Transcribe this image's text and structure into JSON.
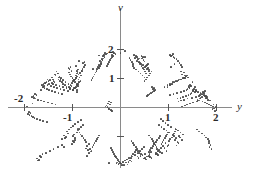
{
  "figure": {
    "background_color": "#ffffff",
    "point_color": "#4a4a4a",
    "axis_color": "#8a8a8a",
    "label_color": "#2a2a2a"
  },
  "axes": {
    "vertical": {
      "name": "v",
      "tick_labels": [
        "2",
        "1"
      ],
      "tick_values": [
        2,
        1
      ]
    },
    "horizontal": {
      "name": "y",
      "tick_labels": [
        "-2",
        "-1",
        "1",
        "2"
      ],
      "tick_values": [
        -2,
        -1,
        1,
        2
      ]
    }
  },
  "chart_data": {
    "type": "scatter",
    "title": "",
    "xlabel": "y",
    "ylabel": "v",
    "xlim": [
      -2.33,
      2.33
    ],
    "ylim": [
      -2.06,
      2.33
    ],
    "grid": false,
    "legend": null,
    "marker": {
      "shape": "circle",
      "size": 1.7,
      "color": "#4a4a4a"
    },
    "n_points": 700,
    "region": {
      "shape": "ellipse",
      "center": [
        0.0,
        0.07
      ],
      "semi_axis_x": 2.1,
      "semi_axis_y": 1.95
    },
    "x": [
      -0.01,
      1.12,
      -1.53,
      0.64,
      -0.87,
      1.78,
      0.22,
      -1.19,
      1.41,
      -0.46,
      0.95,
      -1.84,
      0.08,
      1.62,
      -0.71,
      0.39,
      -1.31,
      1.05,
      -0.25,
      1.93,
      -0.58,
      0.77,
      -1.67,
      0.14,
      1.25,
      -1.02,
      0.51,
      -1.95,
      1.49,
      -0.33,
      0.86,
      -1.44,
      0.03,
      1.71,
      -0.94,
      0.61,
      -1.22,
      1.34,
      -0.17,
      1.86,
      -0.68,
      0.43,
      -1.58,
      1.16,
      -0.05,
      1.99,
      -0.81,
      0.72,
      -1.37,
      0.28,
      1.55,
      -1.09,
      0.48,
      -1.79,
      1.27,
      -0.39,
      0.91,
      -1.51,
      0.11,
      1.66,
      -0.76,
      0.35,
      -1.28,
      1.09,
      -0.21,
      1.89,
      -0.63,
      0.68,
      -1.72,
      0.18,
      1.31,
      -0.98,
      0.55,
      -1.91,
      1.44,
      -0.29,
      0.82,
      -1.47,
      0.06,
      1.75,
      -0.89,
      0.58,
      -1.16,
      1.38,
      -0.13,
      1.82,
      -0.72,
      0.46,
      -1.61,
      1.2,
      -0.09,
      1.96,
      -0.85,
      0.75,
      -1.34,
      0.31,
      1.52,
      -1.05,
      0.52,
      -1.76,
      1.23,
      -0.43,
      0.97,
      -1.55,
      0.16,
      1.69,
      -0.79,
      0.37,
      -1.25,
      1.02,
      -0.24,
      1.85,
      -0.66,
      0.65,
      -1.7,
      0.2,
      1.28,
      -1.0,
      0.57,
      -1.88,
      1.46,
      -0.31,
      0.79,
      -1.42,
      0.01,
      1.73,
      -0.92,
      0.6,
      -1.14,
      1.36,
      -0.15,
      1.8,
      -0.7,
      0.44,
      -1.64,
      1.18,
      -0.07,
      1.91,
      -0.83,
      0.73,
      -1.32,
      0.33,
      1.57,
      -1.07,
      0.5,
      -1.82,
      1.21,
      -0.41,
      0.99,
      -1.57,
      0.19,
      1.64,
      -0.74,
      0.41,
      -1.3,
      1.07,
      -0.27,
      1.87,
      -0.61,
      0.7,
      -1.74,
      0.23,
      1.33,
      -0.96,
      0.53,
      -1.93,
      1.42,
      -0.35,
      0.84,
      -1.4,
      -0.02,
      1.68,
      -0.9,
      0.63,
      -1.18,
      1.4,
      -0.11,
      1.77,
      -0.67,
      0.47,
      -1.6,
      1.13,
      -0.04,
      1.94,
      -0.86,
      0.78,
      -1.36,
      0.29,
      1.5,
      -1.03,
      0.54,
      -1.85,
      1.3,
      -0.45,
      0.93,
      -1.49,
      0.13,
      1.6,
      -0.77,
      0.42,
      -1.27,
      1.04,
      -0.22,
      1.83,
      -0.64,
      0.67,
      -1.66,
      0.25,
      1.35,
      -0.95,
      0.56,
      -1.9,
      1.43,
      -0.37,
      0.88,
      -1.38,
      0.04,
      1.65,
      -0.91,
      0.62,
      -1.1,
      1.32,
      -0.19,
      1.79,
      -0.73,
      0.49,
      -1.62,
      1.15,
      -0.06,
      1.97,
      -0.88,
      0.76,
      -1.29,
      0.36,
      1.54,
      -1.08,
      0.45,
      -1.81,
      1.24,
      -0.47,
      1.01,
      -1.53,
      0.21,
      1.61,
      -0.8,
      0.38,
      -1.23,
      1.1,
      -0.3,
      1.84,
      -0.59,
      0.71,
      -1.68,
      0.26,
      1.29,
      -0.99,
      0.59,
      -1.86,
      1.39,
      -0.34,
      0.85,
      -1.43,
      0.09,
      1.63,
      -0.93,
      0.66,
      -1.12,
      1.26,
      -0.16,
      1.76,
      -0.75,
      0.4,
      -1.59,
      1.11,
      -0.08,
      1.92,
      -0.84,
      0.74,
      -1.26,
      0.34,
      1.47,
      -1.06,
      0.51,
      -1.78,
      1.19,
      -0.49,
      1.03,
      -1.46,
      0.24,
      1.58,
      -0.82,
      0.36,
      -1.2,
      1.12,
      -0.32,
      1.81,
      -0.57,
      0.69,
      -1.63,
      0.27,
      1.22,
      -0.97,
      0.64,
      -1.83,
      1.37,
      -0.36,
      0.87,
      -1.41,
      0.12,
      1.56,
      -0.94,
      0.68,
      -1.08,
      1.2,
      -0.18,
      1.73,
      -0.78,
      0.39,
      -1.54,
      1.08,
      -0.1,
      1.88,
      -0.87,
      0.72,
      -1.21,
      0.38,
      1.45,
      -1.04,
      0.58,
      -1.73,
      1.14,
      -0.51,
      1.06,
      -1.39,
      0.3,
      1.51,
      -0.85,
      0.34,
      -1.17,
      1.16,
      -0.28,
      1.78,
      -0.55,
      0.66,
      -1.56,
      0.32,
      1.17,
      -0.92,
      0.61,
      -1.8,
      1.31,
      -0.38,
      0.89,
      -1.35,
      0.17,
      1.48,
      -0.96,
      0.7,
      -1.04,
      1.14,
      -0.2,
      1.7,
      -0.81,
      0.43,
      -1.5,
      1.0,
      -0.12,
      1.84,
      -0.89,
      0.69,
      -1.15,
      0.42,
      1.41,
      -1.01,
      0.6,
      -1.67,
      1.05,
      -0.53,
      1.08,
      -1.33,
      0.35,
      1.44,
      -0.88,
      0.31,
      -1.13,
      1.19,
      -0.26,
      1.74,
      -0.52,
      0.63,
      -1.48,
      0.37,
      1.12,
      -0.9,
      0.58,
      -1.75,
      1.25,
      -0.4,
      0.92,
      -1.28,
      0.22,
      1.39,
      -0.99,
      0.73,
      -1.0,
      1.09,
      -0.23,
      1.66,
      -0.84,
      0.46,
      -1.44,
      0.95,
      -0.14,
      1.8,
      -0.91,
      0.67,
      -1.09,
      0.46,
      1.36,
      -0.98,
      0.63,
      -1.6,
      0.98,
      -0.55,
      1.11,
      -1.26,
      0.4,
      1.38,
      -0.91,
      0.28,
      -1.06,
      1.22,
      -0.24,
      1.69,
      -0.5,
      0.6,
      -1.4,
      0.41,
      1.07,
      -0.87,
      0.55,
      -1.69,
      1.17,
      -0.42,
      0.94,
      -1.2,
      0.26,
      1.32,
      -1.02,
      0.76,
      -0.95,
      1.03,
      -0.25,
      1.61,
      -0.86,
      0.48,
      -1.37,
      0.9,
      -0.16,
      1.75,
      -0.93,
      0.65,
      -1.03,
      0.5,
      1.3,
      -0.95,
      0.66,
      -1.52,
      0.93,
      -0.57,
      1.13,
      -1.18,
      0.44,
      1.33,
      -0.94,
      0.25,
      -0.99,
      1.25,
      -0.21,
      1.64,
      -0.48,
      0.57,
      -1.31,
      0.45,
      1.02,
      -0.83,
      0.52,
      -1.62,
      1.1,
      -0.44,
      0.96,
      -1.13,
      0.29,
      1.26,
      -1.05,
      0.79,
      -0.89,
      0.97,
      -0.27,
      1.56,
      -0.88,
      0.5,
      -1.3,
      0.85,
      -0.18,
      1.7,
      -0.96,
      0.62,
      -0.97,
      0.54,
      1.24,
      -0.92,
      0.69,
      -1.44,
      0.88,
      -0.59,
      1.15,
      -1.1,
      0.48,
      1.27,
      -0.97,
      0.22,
      -0.92,
      1.28,
      -0.19,
      1.58,
      -0.46,
      0.54,
      -1.22,
      0.49,
      0.97,
      -0.79,
      0.49,
      -1.54,
      1.03,
      -0.46,
      0.98,
      -1.06,
      0.32,
      1.2,
      -1.08,
      0.82,
      -0.83,
      0.91,
      -0.29,
      1.5,
      -0.9,
      0.53,
      -1.23,
      0.8,
      -0.2,
      1.64,
      -0.99,
      0.59,
      -0.91,
      0.58,
      1.18,
      -0.89,
      0.72,
      -1.36,
      0.83,
      -0.61,
      1.17,
      -1.02,
      0.52,
      1.21,
      -1.0,
      0.19,
      -0.85,
      1.31,
      -0.17,
      1.52,
      -0.44,
      0.51,
      -1.14,
      0.53,
      0.92,
      -0.75,
      0.46,
      -1.45,
      0.96,
      -0.48,
      1.0,
      -0.99,
      0.35,
      1.14,
      -1.11,
      0.85,
      -0.77,
      0.85,
      -0.31,
      1.43,
      -0.92,
      0.56,
      -1.16,
      0.75,
      -0.22,
      1.57,
      -1.02,
      0.56,
      -0.85,
      0.62,
      1.12,
      -0.86,
      0.75,
      -1.28,
      0.78,
      -0.63,
      1.19,
      -0.94,
      0.56,
      1.15,
      -1.03,
      0.16,
      -0.78,
      1.34,
      -0.15,
      1.46,
      -0.42,
      0.48,
      -1.06,
      0.57,
      0.87,
      -0.71,
      0.43,
      -1.37,
      0.89,
      -0.5,
      1.02,
      -0.92,
      0.38,
      1.08,
      -1.14,
      0.88,
      -0.71,
      0.79,
      -0.33,
      1.37,
      -0.94,
      0.59,
      -1.09,
      0.7,
      -0.24,
      1.51,
      -1.05,
      0.53,
      -0.79,
      0.66,
      1.06,
      -0.83,
      0.78,
      -1.2,
      0.73,
      -0.65,
      1.21,
      -0.86,
      0.6,
      1.09,
      -1.06,
      0.13,
      -0.71,
      1.37,
      -0.13,
      1.4,
      -0.4,
      0.45,
      -0.98,
      0.61,
      0.82,
      -0.67,
      0.4,
      -1.29,
      0.82,
      -0.52,
      1.04,
      -0.85,
      0.41,
      1.02,
      -1.17,
      0.91,
      -0.65,
      0.73,
      -0.35,
      1.3,
      -0.96,
      0.62,
      -1.02,
      0.65,
      -0.26,
      1.44,
      -1.08,
      0.5,
      -0.73,
      0.7,
      1.0,
      -0.8,
      0.81,
      -1.12,
      0.68,
      -0.67,
      1.23,
      -0.78,
      0.64,
      1.03,
      -1.09,
      0.1,
      -0.64,
      1.4
    ],
    "y": [
      1.9,
      1.52,
      0.98,
      -1.72,
      1.61,
      0.42,
      -1.85,
      -1.35,
      0.75,
      1.8,
      -1.48,
      0.15,
      1.95,
      -0.82,
      -1.66,
      1.7,
      1.18,
      1.42,
      -1.9,
      0.12,
      1.35,
      -1.62,
      0.62,
      -1.95,
      1.25,
      -1.25,
      1.75,
      0.05,
      0.88,
      1.88,
      -1.55,
      1.05,
      -1.98,
      0.55,
      1.45,
      -1.7,
      -1.08,
      1.02,
      1.92,
      0.25,
      -1.45,
      1.78,
      0.85,
      -1.3,
      -1.93,
      -0.08,
      1.28,
      -1.58,
      1.15,
      1.82,
      0.72,
      1.38,
      -1.75,
      0.48,
      -1.12,
      1.68,
      -1.38,
      0.92,
      -1.89,
      0.35,
      1.58,
      -1.68,
      1.08,
      1.85,
      0.18,
      -1.42,
      -1.5,
      0.68,
      -1.82,
      1.72,
      1.22,
      -1.18,
      1.48,
      -0.15,
      0.78,
      1.87,
      -1.52,
      0.95,
      -1.96,
      0.58,
      1.32,
      -1.65,
      -1.05,
      1.12,
      1.9,
      0.28,
      -1.4,
      1.76,
      0.82,
      -1.22,
      -1.91,
      -0.12,
      1.18,
      -1.6,
      1.25,
      1.79,
      0.65,
      1.42,
      -1.78,
      0.45,
      -1.02,
      1.62,
      -1.32,
      0.88,
      -1.86,
      0.38,
      1.55,
      -1.72,
      1.02,
      1.83,
      0.22,
      -1.35,
      -1.55,
      0.72,
      -1.8,
      1.65,
      1.15,
      -1.15,
      1.52,
      -0.18,
      0.75,
      1.84,
      -1.45,
      0.98,
      -1.92,
      0.52,
      1.28,
      -1.58,
      -1.0,
      1.08,
      1.88,
      0.32,
      -1.32,
      1.7,
      0.78,
      -1.18,
      -1.88,
      -0.05,
      1.12,
      -1.55,
      1.18,
      1.75,
      0.62,
      1.35,
      -1.72,
      0.42,
      -0.98,
      1.55,
      -1.28,
      0.85,
      -1.82,
      0.32,
      1.48,
      -1.65,
      0.98,
      1.8,
      0.15,
      -1.28,
      -1.48,
      0.68,
      -1.75,
      1.58,
      1.12,
      -1.1,
      1.45,
      -0.22,
      0.72,
      1.82,
      -1.38,
      0.92,
      -1.9,
      0.48,
      1.22,
      -1.52,
      -0.95,
      1.05,
      1.85,
      0.35,
      -1.25,
      1.65,
      0.75,
      -1.12,
      -1.85,
      -0.02,
      1.05,
      -1.48,
      1.12,
      1.72,
      0.58,
      1.28,
      -1.68,
      0.38,
      -0.92,
      1.48,
      -1.22,
      0.82,
      -1.78,
      0.28,
      1.42,
      -1.6,
      0.92,
      1.78,
      0.12,
      -1.22,
      -1.42,
      0.65,
      -1.7,
      1.52,
      1.08,
      -1.05,
      1.38,
      -0.25,
      0.68,
      1.78,
      -1.32,
      0.88,
      -1.86,
      0.45,
      1.18,
      -1.45,
      -0.88,
      1.02,
      1.82,
      0.38,
      -1.18,
      1.6,
      0.72,
      -1.05,
      -1.8,
      0.02,
      0.98,
      -1.42,
      1.05,
      1.68,
      0.55,
      1.22,
      -1.62,
      0.35,
      -0.85,
      1.42,
      -1.15,
      0.78,
      -1.72,
      0.25,
      1.35,
      -1.55,
      0.88,
      1.75,
      0.08,
      -1.15,
      -1.35,
      0.62,
      -1.65,
      1.45,
      1.02,
      -0.98,
      1.32,
      -0.28,
      0.65,
      1.75,
      -1.25,
      0.85,
      -1.82,
      0.42,
      1.12,
      -1.38,
      -0.82,
      0.98,
      1.78,
      0.42,
      -1.12,
      1.55,
      0.68,
      -0.98,
      -1.75,
      0.05,
      0.92,
      -1.35,
      1.0,
      1.62,
      0.52,
      1.15,
      -1.58,
      0.32,
      -0.78,
      1.35,
      -1.08,
      0.75,
      -1.68,
      0.22,
      1.28,
      -1.48,
      0.82,
      1.72,
      0.05,
      -1.08,
      -1.28,
      0.58,
      -1.6,
      1.38,
      0.98,
      -0.92,
      1.25,
      -0.32,
      0.62,
      1.7,
      -1.18,
      0.82,
      -1.78,
      0.38,
      1.05,
      -1.32,
      -0.75,
      0.95,
      1.75,
      0.45,
      -1.05,
      1.5,
      0.65,
      -0.92,
      -1.7,
      0.08,
      0.88,
      -1.28,
      0.95,
      1.58,
      0.48,
      1.08,
      -1.52,
      0.28,
      -0.72,
      1.28,
      -1.02,
      0.72,
      -1.62,
      0.18,
      1.22,
      -1.42,
      0.78,
      1.68,
      0.02,
      -1.02,
      -1.22,
      0.55,
      -1.55,
      1.32,
      0.92,
      -0.85,
      1.18,
      -0.35,
      0.58,
      1.65,
      -1.12,
      0.78,
      -1.72,
      0.35,
      0.98,
      -1.25,
      -0.68,
      0.92,
      1.7,
      0.48,
      -0.98,
      1.45,
      0.62,
      -0.85,
      -1.65,
      0.12,
      0.82,
      -1.22,
      0.88,
      1.52,
      0.45,
      1.02,
      -1.45,
      0.25,
      -0.65,
      1.22,
      -0.95,
      0.68,
      -1.55,
      0.15,
      1.15,
      -1.35,
      0.72,
      1.62,
      -0.02,
      -0.95,
      -1.15,
      0.52,
      -1.48,
      1.25,
      0.88,
      -0.78,
      1.12,
      -0.38,
      0.55,
      1.6,
      -1.05,
      0.75,
      -1.65,
      0.32,
      0.92,
      -1.18,
      -0.62,
      0.88,
      1.65,
      0.52,
      -0.92,
      1.38,
      0.58,
      -0.78,
      -1.58,
      0.15,
      0.78,
      -1.15,
      0.82,
      1.48,
      0.42,
      0.95,
      -1.38,
      0.22,
      -0.58,
      1.15,
      -0.88,
      0.65,
      -1.48,
      0.12,
      1.08,
      -1.28,
      0.68,
      1.55,
      -0.05,
      -0.88,
      -1.08,
      0.48,
      -1.42,
      1.18,
      0.82,
      -0.72,
      1.05,
      -0.42,
      0.52,
      1.52,
      -0.98,
      0.72,
      -1.58,
      0.28,
      0.85,
      -1.12,
      -0.55,
      0.82,
      1.58,
      0.55,
      -0.85,
      1.32,
      0.55,
      -0.72,
      -1.52,
      0.18,
      0.72,
      -1.08,
      0.75,
      1.42,
      0.38,
      0.88,
      -1.32,
      0.18,
      -0.52,
      1.08,
      -0.82,
      0.62,
      -1.42,
      0.08,
      1.02,
      -1.22,
      0.62,
      1.48,
      -0.08,
      -0.82,
      -1.02,
      0.45,
      -1.35,
      1.12,
      0.78,
      -0.65,
      0.98,
      -0.45,
      0.48,
      1.45,
      -0.92,
      0.68,
      -1.52,
      0.25,
      0.78,
      -1.05,
      -0.48,
      0.78,
      1.52,
      0.58,
      -0.78,
      1.25,
      0.52,
      -0.65,
      -1.45,
      0.22,
      0.68,
      -1.02,
      0.68,
      1.35,
      0.35,
      0.82,
      -1.25,
      0.15,
      -0.45,
      1.02,
      -0.75,
      0.58,
      -1.35,
      0.05,
      0.95,
      -1.15,
      0.55,
      1.42,
      -0.12,
      -0.75,
      -0.95,
      0.42,
      -1.28,
      1.05,
      0.72,
      -0.58,
      0.92,
      -0.48,
      0.45,
      1.38,
      -0.85,
      0.65,
      -1.45,
      0.22,
      0.72,
      -0.98,
      -0.42,
      0.72,
      1.45,
      0.62,
      -0.72,
      1.18,
      0.48,
      -0.58,
      -1.38,
      0.25,
      0.62,
      -0.95,
      0.62,
      1.28,
      0.32,
      0.75,
      -1.18,
      0.12,
      -0.38,
      0.95
    ]
  }
}
